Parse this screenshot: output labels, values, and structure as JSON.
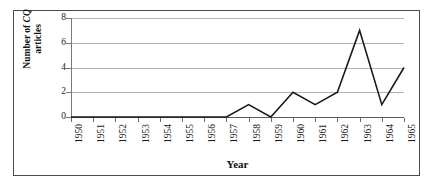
{
  "chart_data": {
    "type": "line",
    "title": "",
    "xlabel": "Year",
    "ylabel_line1": "Number of CQ",
    "ylabel_line2": "articles",
    "ylabel_italic_part": "CQ",
    "categories": [
      "1950",
      "1951",
      "1952",
      "1953",
      "1954",
      "1955",
      "1956",
      "1957",
      "1958",
      "1959",
      "1960",
      "1961",
      "1962",
      "1963",
      "1964",
      "1965"
    ],
    "values": [
      0,
      0,
      0,
      0,
      0,
      0,
      0,
      0,
      1,
      0,
      2,
      1,
      2,
      7,
      1,
      4
    ],
    "series": [
      {
        "name": "Number of CQ articles",
        "values": [
          0,
          0,
          0,
          0,
          0,
          0,
          0,
          0,
          1,
          0,
          2,
          1,
          2,
          7,
          1,
          4
        ]
      }
    ],
    "x": [
      "1950",
      "1951",
      "1952",
      "1953",
      "1954",
      "1955",
      "1956",
      "1957",
      "1958",
      "1959",
      "1960",
      "1961",
      "1962",
      "1963",
      "1964",
      "1965"
    ],
    "ylim": [
      0,
      8
    ],
    "yticks": [
      "0",
      "2",
      "4",
      "6",
      "8"
    ],
    "ytick_values": [
      0,
      2,
      4,
      6,
      8
    ],
    "xlim": [
      "1950",
      "1965"
    ],
    "grid": "horizontal",
    "legend": "none",
    "line_color": "#1a1a1a",
    "grid_color": "#b3b3b3",
    "axis_color": "#5a5a5a",
    "frame_color": "#4a4a4a",
    "background": "#ffffff",
    "annotations": []
  }
}
